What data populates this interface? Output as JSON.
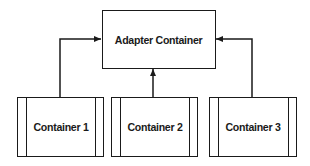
{
  "diagram": {
    "type": "adapter-pattern",
    "adapter": {
      "label": "Adapter Container"
    },
    "containers": [
      {
        "label": "Container 1"
      },
      {
        "label": "Container 2"
      },
      {
        "label": "Container 3"
      }
    ],
    "edges": [
      {
        "from": "Container 1",
        "to": "Adapter Container",
        "direction": "left-side"
      },
      {
        "from": "Container 2",
        "to": "Adapter Container",
        "direction": "bottom"
      },
      {
        "from": "Container 3",
        "to": "Adapter Container",
        "direction": "right-side"
      }
    ],
    "colors": {
      "stroke": "#1a1a1a",
      "background": "#ffffff",
      "text": "#1a1a1a"
    }
  }
}
